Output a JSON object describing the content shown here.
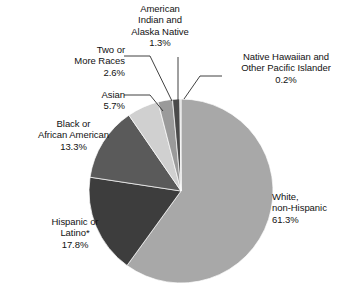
{
  "chart_data": {
    "type": "pie",
    "title": "",
    "subtitle": "",
    "xlabel": "",
    "ylabel": "",
    "legend_position": "callout-labels",
    "grid": false,
    "units": "percent",
    "start_angle_deg": 0,
    "direction": "clockwise",
    "center": {
      "x": 181,
      "y": 191,
      "r": 92
    },
    "categories": [
      "White, non-Hispanic",
      "Hispanic or Latino*",
      "Black or African American",
      "Asian",
      "Two or More Races",
      "American Indian and Alaska Native",
      "Native Hawaiian and Other Pacific Islander"
    ],
    "values": [
      61.3,
      17.8,
      13.3,
      5.7,
      2.6,
      1.3,
      0.2
    ],
    "colors": [
      "#a8a8a8",
      "#3d3d3d",
      "#5a5a5a",
      "#d0d0d0",
      "#9a9a9a",
      "#4a4a4a",
      "#c8c8c8"
    ],
    "slices": [
      {
        "name": "White, non-Hispanic",
        "value": 61.3,
        "value_label": "61.3%",
        "color": "#a8a8a8"
      },
      {
        "name": "Hispanic or Latino*",
        "value": 17.8,
        "value_label": "17.8%",
        "color": "#3d3d3d"
      },
      {
        "name": "Black or African American",
        "value": 13.3,
        "value_label": "13.3%",
        "color": "#5a5a5a"
      },
      {
        "name": "Asian",
        "value": 5.7,
        "value_label": "5.7%",
        "color": "#d0d0d0"
      },
      {
        "name": "Two or More Races",
        "value": 2.6,
        "value_label": "2.6%",
        "color": "#9a9a9a"
      },
      {
        "name": "American Indian and Alaska Native",
        "value": 1.3,
        "value_label": "1.3%",
        "color": "#4a4a4a"
      },
      {
        "name": "Native Hawaiian and Other Pacific Islander",
        "value": 0.2,
        "value_label": "0.2%",
        "color": "#c8c8c8"
      }
    ]
  },
  "labels": {
    "american_indian": {
      "line1": "American",
      "line2": "Indian and",
      "line3": "Alaska Native",
      "pct": "1.3%"
    },
    "native_hawaiian": {
      "line1": "Native Hawaiian and",
      "line2": "Other Pacific Islander",
      "pct": "0.2%"
    },
    "two_or_more": {
      "line1": "Two or",
      "line2": "More Races",
      "pct": "2.6%"
    },
    "asian": {
      "line1": "Asian",
      "pct": "5.7%"
    },
    "black": {
      "line1": "Black or",
      "line2": "African American",
      "pct": "13.3%"
    },
    "hispanic": {
      "line1": "Hispanic or",
      "line2": "Latino*",
      "pct": "17.8%"
    },
    "white": {
      "line1": "White,",
      "line2": "non-Hispanic",
      "pct": "61.3%"
    }
  },
  "style": {
    "background": "#ffffff",
    "text_color": "#121212",
    "leader_line_color": "#2b2b2b"
  }
}
